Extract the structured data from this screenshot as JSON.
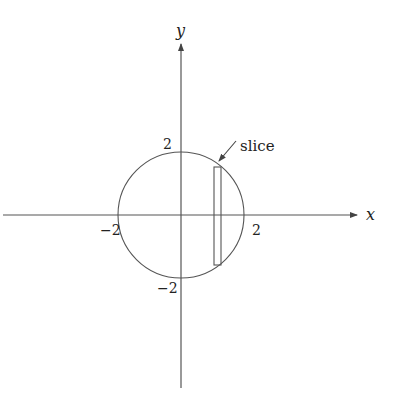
{
  "diagram": {
    "type": "circle-cross-section",
    "axes": {
      "x_label": "x",
      "y_label": "y",
      "ticks": {
        "x_pos": "2",
        "x_neg": "−2",
        "y_pos": "2",
        "y_neg": "−2"
      }
    },
    "circle": {
      "center": [
        0,
        0
      ],
      "radius": 2
    },
    "slice": {
      "label": "slice"
    },
    "colors": {
      "stroke": "#555555",
      "text": "#222222",
      "background": "#ffffff"
    }
  }
}
